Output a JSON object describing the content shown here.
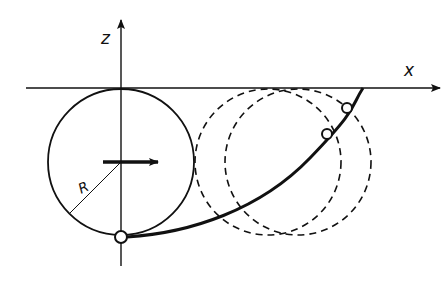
{
  "diagram": {
    "type": "rolling-circle-cycloid",
    "labels": {
      "z_axis": "z",
      "x_axis": "x",
      "radius": "R"
    },
    "colors": {
      "ink": "#111111",
      "background": "#ffffff"
    },
    "elements": {
      "solid_circle": {
        "description": "rolling circle at start position"
      },
      "dashed_circles": [
        {
          "description": "circle at later position 1"
        },
        {
          "description": "circle at later position 2"
        }
      ],
      "trace_curve": {
        "description": "path traced by point on circle (cycloid)"
      },
      "motion_arrow": {
        "description": "direction of rolling, +x"
      },
      "markers": [
        {
          "description": "start point at bottom of circle"
        },
        {
          "description": "point on curve at position 1"
        },
        {
          "description": "point on curve at position 2"
        }
      ]
    }
  }
}
